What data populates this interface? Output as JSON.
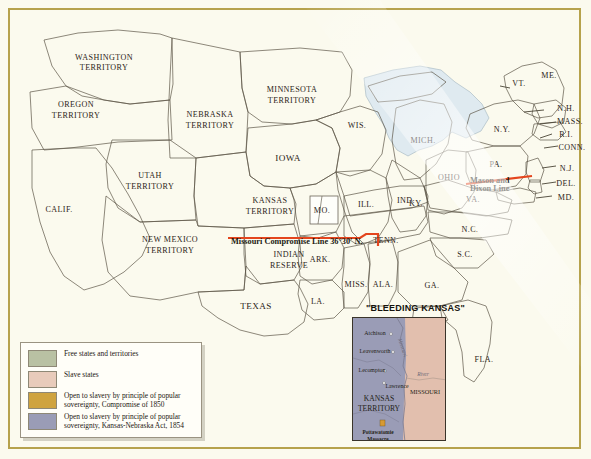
{
  "map": {
    "title_inset": "\"BLEEDING KANSAS\"",
    "colors": {
      "free": "#b9c1a3",
      "slave": "#e2bfae",
      "popular_1850": "#cfa33f",
      "popular_1854": "#9a9cb6",
      "water": "#dfeaf0",
      "background": "#fbfaee",
      "frame": "#b6a24c",
      "red_line": "#e4451d",
      "border": "#5d5647"
    },
    "regions": [
      {
        "name": "WASHINGTON TERRITORY",
        "category": "free"
      },
      {
        "name": "OREGON TERRITORY",
        "category": "free"
      },
      {
        "name": "UTAH TERRITORY",
        "category": "popular_1850"
      },
      {
        "name": "NEW MEXICO TERRITORY",
        "category": "popular_1850"
      },
      {
        "name": "CALIF.",
        "category": "free"
      },
      {
        "name": "NEBRASKA TERRITORY",
        "category": "popular_1854"
      },
      {
        "name": "KANSAS TERRITORY",
        "category": "popular_1854"
      },
      {
        "name": "MINNESOTA TERRITORY",
        "category": "free"
      },
      {
        "name": "INDIAN RESERVE",
        "category": "popular_1850"
      },
      {
        "name": "TEXAS",
        "category": "slave"
      },
      {
        "name": "IOWA",
        "category": "free"
      },
      {
        "name": "WIS.",
        "category": "free"
      },
      {
        "name": "MICH.",
        "category": "free"
      },
      {
        "name": "ILL.",
        "category": "free"
      },
      {
        "name": "IND.",
        "category": "free"
      },
      {
        "name": "OHIO",
        "category": "free"
      },
      {
        "name": "MO.",
        "category": "slave"
      },
      {
        "name": "ARK.",
        "category": "slave"
      },
      {
        "name": "LA.",
        "category": "slave"
      },
      {
        "name": "MISS.",
        "category": "slave"
      },
      {
        "name": "ALA.",
        "category": "slave"
      },
      {
        "name": "GA.",
        "category": "slave"
      },
      {
        "name": "FLA.",
        "category": "slave"
      },
      {
        "name": "S.C.",
        "category": "slave"
      },
      {
        "name": "N.C.",
        "category": "slave"
      },
      {
        "name": "TENN.",
        "category": "slave"
      },
      {
        "name": "KY.",
        "category": "slave"
      },
      {
        "name": "VA.",
        "category": "slave"
      },
      {
        "name": "MD.",
        "category": "slave"
      },
      {
        "name": "DEL.",
        "category": "slave"
      },
      {
        "name": "PA.",
        "category": "free"
      },
      {
        "name": "N.J.",
        "category": "free"
      },
      {
        "name": "N.Y.",
        "category": "free"
      },
      {
        "name": "CONN.",
        "category": "free"
      },
      {
        "name": "R.I.",
        "category": "free"
      },
      {
        "name": "MASS.",
        "category": "free"
      },
      {
        "name": "N.H.",
        "category": "free"
      },
      {
        "name": "VT.",
        "category": "free"
      },
      {
        "name": "ME.",
        "category": "free"
      }
    ],
    "labels": {
      "washington": "WASHINGTON",
      "washington2": "TERRITORY",
      "oregon": "OREGON",
      "oregon2": "TERRITORY",
      "utah": "UTAH",
      "utah2": "TERRITORY",
      "newmexico": "NEW MEXICO",
      "newmexico2": "TERRITORY",
      "calif": "CALIF.",
      "nebraska": "NEBRASKA",
      "nebraska2": "TERRITORY",
      "kansas": "KANSAS",
      "kansas2": "TERRITORY",
      "minnesota": "MINNESOTA",
      "minnesota2": "TERRITORY",
      "indian": "INDIAN",
      "indian2": "RESERVE",
      "texas": "TEXAS",
      "iowa": "IOWA",
      "wis": "WIS.",
      "mich": "MICH.",
      "ill": "ILL.",
      "ind": "IND.",
      "ohio": "OHIO",
      "mo": "MO.",
      "ark": "ARK.",
      "la": "LA.",
      "miss": "MISS.",
      "ala": "ALA.",
      "ga": "GA.",
      "fla": "FLA.",
      "sc": "S.C.",
      "nc": "N.C.",
      "tenn": "TENN.",
      "ky": "KY.",
      "va": "VA.",
      "md": "MD.",
      "del": "DEL.",
      "pa": "PA.",
      "nj": "N.J.",
      "ny": "N.Y.",
      "conn": "CONN.",
      "ri": "R.I.",
      "mass": "MASS.",
      "nh": "N.H.",
      "vt": "VT.",
      "me": "ME."
    },
    "annotations": {
      "missouri_compromise": "Missouri Compromise Line 36°30' N.",
      "mason_dixon_1": "Mason and",
      "mason_dixon_2": "Dixon Line"
    }
  },
  "legend": {
    "items": [
      {
        "swatch": "#b9c1a3",
        "text": "Free states and territories"
      },
      {
        "swatch": "#e2bfae",
        "text": "Slave states"
      },
      {
        "swatch": "#cfa33f",
        "text": "Open to slavery by principle of popular sovereignty, Compromise of 1850"
      },
      {
        "swatch": "#9a9cb6",
        "text": "Open to slavery by principle of popular sovereignty, Kansas-Nebraska Act, 1854"
      }
    ]
  },
  "inset": {
    "title": "\"BLEEDING KANSAS\"",
    "territory_1": "KANSAS",
    "territory_2": "TERRITORY",
    "state": "MISSOURI",
    "river": "Missouri",
    "river2": "River",
    "cities": [
      {
        "name": "Atchison"
      },
      {
        "name": "Leavenworth"
      },
      {
        "name": "Lecompton"
      },
      {
        "name": "Lawrence"
      }
    ],
    "event_1": "Pottawatomie",
    "event_2": "Massacre"
  }
}
